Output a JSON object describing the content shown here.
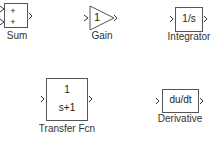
{
  "blocks": {
    "sum": {
      "label": "Sum",
      "signs": [
        "+",
        "+"
      ]
    },
    "gain": {
      "label": "Gain",
      "value": "1"
    },
    "integrator": {
      "label": "Integrator",
      "expr": "1/s"
    },
    "transfer_fcn": {
      "label": "Transfer Fcn",
      "numerator": "1",
      "denominator": "s+1"
    },
    "derivative": {
      "label": "Derivative",
      "expr": "du/dt"
    }
  }
}
